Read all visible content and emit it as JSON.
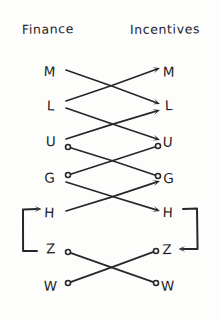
{
  "diagram": {
    "title_visible": false,
    "background_color": "#fdfdfc",
    "ink_color": "#26262d",
    "style": "hand-drawn-sketch",
    "columns": [
      {
        "id": "left",
        "header": "Finance",
        "x": 60,
        "header_x": 22,
        "header_y": 34
      },
      {
        "id": "right",
        "header": "Incentives",
        "x": 168,
        "header_x": 130,
        "header_y": 34
      }
    ],
    "rows": [
      {
        "id": "M",
        "label": "M",
        "y": 71,
        "left_x": 50,
        "right_x": 168
      },
      {
        "id": "L",
        "label": "L",
        "y": 106,
        "left_x": 50,
        "right_x": 168
      },
      {
        "id": "U",
        "label": "U",
        "y": 142,
        "left_x": 50,
        "right_x": 168
      },
      {
        "id": "G",
        "label": "G",
        "y": 178,
        "left_x": 50,
        "right_x": 168
      },
      {
        "id": "H",
        "label": "H",
        "y": 213,
        "left_x": 50,
        "right_x": 168
      },
      {
        "id": "Z",
        "label": "Z",
        "y": 249,
        "left_x": 50,
        "right_x": 168
      },
      {
        "id": "W",
        "label": "W",
        "y": 285,
        "left_x": 50,
        "right_x": 168
      }
    ],
    "edges": [
      {
        "id": "e1",
        "from_row": "M",
        "to_row": "L",
        "from_side": "left",
        "to_side": "right",
        "x1": 66,
        "y1": 70,
        "x2": 160,
        "y2": 104,
        "start_marker": "none",
        "end_marker": "arrow"
      },
      {
        "id": "e2",
        "from_row": "L",
        "to_row": "M",
        "from_side": "left",
        "to_side": "right",
        "x1": 66,
        "y1": 101,
        "x2": 160,
        "y2": 68,
        "start_marker": "none",
        "end_marker": "arrow"
      },
      {
        "id": "e3",
        "from_row": "L",
        "to_row": "U",
        "from_side": "left",
        "to_side": "right",
        "x1": 66,
        "y1": 108,
        "x2": 160,
        "y2": 140,
        "start_marker": "none",
        "end_marker": "arrow"
      },
      {
        "id": "e4",
        "from_row": "U",
        "to_row": "L",
        "from_side": "left",
        "to_side": "right",
        "x1": 66,
        "y1": 139,
        "x2": 160,
        "y2": 110,
        "start_marker": "none",
        "end_marker": "arrow"
      },
      {
        "id": "e5",
        "from_row": "U",
        "to_row": "G",
        "from_side": "left",
        "to_side": "right",
        "x1": 68,
        "y1": 147,
        "x2": 158,
        "y2": 176,
        "start_marker": "circle",
        "end_marker": "circle"
      },
      {
        "id": "e6",
        "from_row": "G",
        "to_row": "U",
        "from_side": "left",
        "to_side": "right",
        "x1": 68,
        "y1": 175,
        "x2": 158,
        "y2": 146,
        "start_marker": "circle",
        "end_marker": "circle"
      },
      {
        "id": "e7",
        "from_row": "G",
        "to_row": "H",
        "from_side": "left",
        "to_side": "right",
        "x1": 66,
        "y1": 182,
        "x2": 160,
        "y2": 211,
        "start_marker": "none",
        "end_marker": "arrow"
      },
      {
        "id": "e8",
        "from_row": "H",
        "to_row": "G",
        "from_side": "left",
        "to_side": "right",
        "x1": 66,
        "y1": 211,
        "x2": 160,
        "y2": 181,
        "start_marker": "none",
        "end_marker": "arrow"
      },
      {
        "id": "e9",
        "from_row": "Z",
        "to_row": "W",
        "from_side": "left",
        "to_side": "right",
        "x1": 68,
        "y1": 252,
        "x2": 156,
        "y2": 283,
        "start_marker": "circle",
        "end_marker": "circle"
      },
      {
        "id": "e10",
        "from_row": "W",
        "to_row": "Z",
        "from_side": "left",
        "to_side": "right",
        "x1": 68,
        "y1": 283,
        "x2": 156,
        "y2": 251,
        "start_marker": "circle",
        "end_marker": "circle"
      }
    ],
    "brackets": [
      {
        "id": "left-bracket",
        "shape": "open-bracket",
        "side": "left",
        "spans_rows": [
          "H",
          "Z"
        ],
        "arrow_at": "H",
        "arrow_direction": "right",
        "x": 23,
        "top_y": 209,
        "bottom_y": 251,
        "arm": 14
      },
      {
        "id": "right-bracket",
        "shape": "close-bracket",
        "side": "right",
        "spans_rows": [
          "H",
          "Z"
        ],
        "arrow_at": "Z",
        "arrow_direction": "left",
        "x": 197,
        "top_y": 209,
        "bottom_y": 249,
        "arm": 14
      }
    ]
  }
}
